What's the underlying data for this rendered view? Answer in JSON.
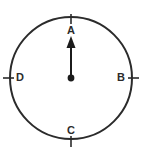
{
  "figure": {
    "type": "compass-rose-diagram",
    "title": "",
    "background_color": "#ffffff",
    "stroke_color": "#2b2b2b",
    "circle": {
      "center_x": 71,
      "center_y": 78,
      "radius": 61,
      "stroke_width": 2
    },
    "center_point": {
      "label": "",
      "radius": 3.2,
      "fill": "#1b1b1b"
    },
    "arrow": {
      "name": "north-arrow",
      "direction": "up",
      "from_x": 71,
      "from_y": 78,
      "to_x": 71,
      "to_y": 37,
      "points_to_label": "A",
      "head_width": 9,
      "head_length": 11
    },
    "labels": [
      {
        "id": "A",
        "text": "A",
        "position": "top",
        "x": 71,
        "y": 31,
        "tick": {
          "x1": 71,
          "y1": 14,
          "x2": 71,
          "y2": 24
        }
      },
      {
        "id": "B",
        "text": "B",
        "position": "right",
        "x": 121,
        "y": 78,
        "tick": {
          "x1": 128,
          "y1": 78,
          "x2": 139,
          "y2": 78
        }
      },
      {
        "id": "C",
        "text": "C",
        "position": "bottom",
        "x": 71,
        "y": 131,
        "tick": {
          "x1": 71,
          "y1": 136,
          "x2": 71,
          "y2": 147
        }
      },
      {
        "id": "D",
        "text": "D",
        "position": "left",
        "x": 20,
        "y": 78,
        "tick": {
          "x1": 3,
          "y1": 78,
          "x2": 14,
          "y2": 78
        }
      }
    ]
  }
}
